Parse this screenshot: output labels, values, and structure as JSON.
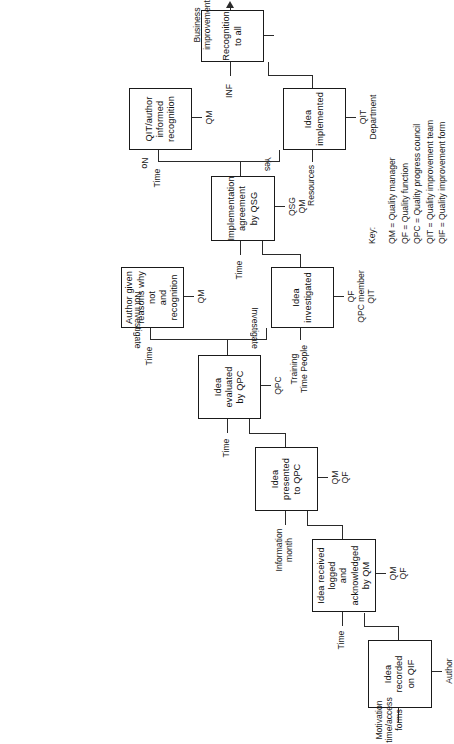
{
  "diagram": {
    "orientation": "rotated-90-ccw",
    "nodes": [
      {
        "id": "n1",
        "label": "Idea\nrecorded\non QIF",
        "input": "Motivation\ntime/access forms",
        "output": "Author"
      },
      {
        "id": "n2",
        "label": "Idea received logged\nand acknowledged\nby QM",
        "input": "Time",
        "output": "QM\nQF"
      },
      {
        "id": "n3",
        "label": "Idea\npresented\nto QPC",
        "input": "Information\nmonth",
        "output": "QM\nQF"
      },
      {
        "id": "n4",
        "label": "Idea\nevaluated\nby QPC",
        "input": "Time",
        "output": "QPC"
      },
      {
        "id": "n5",
        "label": "Author given\nreasons why not\nand recognition",
        "input": "Time",
        "output": "QM"
      },
      {
        "id": "n6",
        "label": "Idea\ninvestigated",
        "input": "Training\nTime People",
        "output": "QF\nQPC member\nQIT"
      },
      {
        "id": "n7",
        "label": "Implementation\nagreement\nby QSG",
        "input": "Time",
        "output": "QSG\nQM"
      },
      {
        "id": "n8",
        "label": "QIT/author\ninformed\nrecognition",
        "input": "Time",
        "output": "QM"
      },
      {
        "id": "n9",
        "label": "Idea\nimplemented",
        "input": "Resources",
        "output": "QIT\nDepartment"
      },
      {
        "id": "n10",
        "label": "Recognition\nto all",
        "input": "INF",
        "output": ""
      }
    ],
    "branch_labels": {
      "not_investigate": "Not investigate",
      "investigate": "Investigate",
      "no": "No",
      "yes": "Yes"
    },
    "final_output": "Business\nimprovement",
    "key": {
      "title": "Key:",
      "entries": [
        "QM = Quality manager",
        "QF = Quality function",
        "QPC = Quality progress council",
        "QIT = Quality improvement team",
        "QIF = Quality improvement form"
      ]
    }
  }
}
